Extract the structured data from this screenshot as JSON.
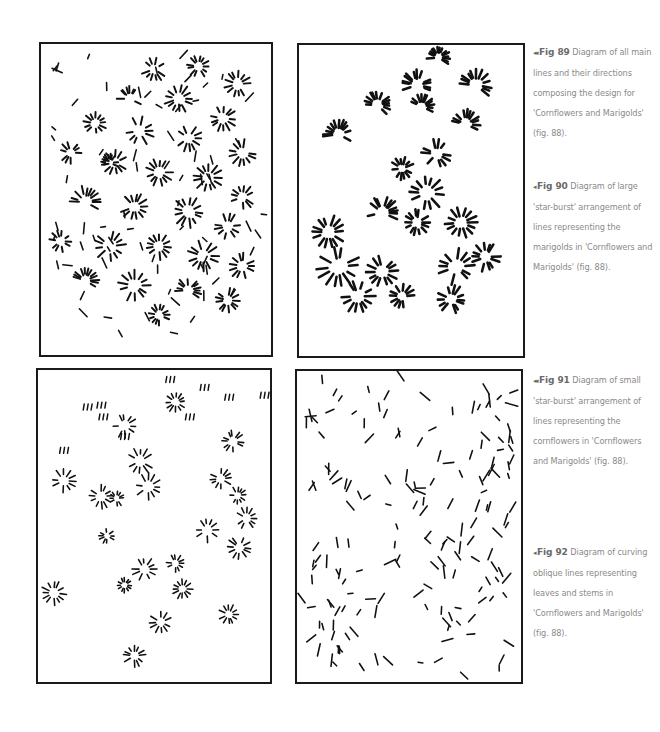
{
  "figures": [
    {
      "id": "fig89",
      "arrow": "◂◂",
      "label": "Fig 89",
      "caption": "Diagram of all main lines and their directions composing the design for 'Cornflowers and Marigolds' (fig. 88).",
      "panel_position": "top-left",
      "content": "dense mix of large and small star-bursts plus curving oblique strokes"
    },
    {
      "id": "fig90",
      "arrow": "◂",
      "label": "Fig 90",
      "caption": "Diagram of large 'star-burst' arrangement of lines representing the marigolds in 'Cornflowers and Marigolds' (fig. 88).",
      "panel_position": "top-right",
      "content": "large star-burst clusters"
    },
    {
      "id": "fig91",
      "arrow": "◂◂",
      "label": "Fig 91",
      "caption": "Diagram of small 'star-burst' arrangement of lines representing the cornflowers in 'Cornflowers and Marigolds' (fig. 88).",
      "panel_position": "bottom-left",
      "content": "small scattered star-bursts"
    },
    {
      "id": "fig92",
      "arrow": "◂",
      "label": "Fig 92",
      "caption": "Diagram of curving oblique lines representing leaves and stems in 'Cornflowers and Marigolds' (fig. 88).",
      "panel_position": "bottom-right",
      "content": "scattered short oblique dashes"
    }
  ],
  "style": {
    "ink": "#111111",
    "caption_text": "#8a8a8a",
    "caption_label": "#6a6a6a",
    "border": "#1a1a1a"
  }
}
